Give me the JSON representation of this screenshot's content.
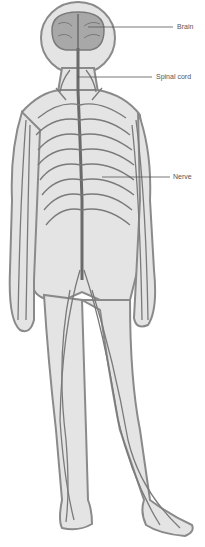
{
  "diagram": {
    "labels": [
      {
        "text": "Brain",
        "x": 177,
        "y": 25,
        "line_from": [
          88,
          27
        ],
        "line_to": [
          173,
          27
        ]
      },
      {
        "text": "Spinal cord",
        "x": 156,
        "y": 73,
        "line_from": [
          77,
          77
        ],
        "line_to": [
          152,
          77
        ]
      },
      {
        "text": "Nerve",
        "x": 173,
        "y": 174,
        "line_from": [
          102,
          177
        ],
        "line_to": [
          170,
          177
        ]
      }
    ],
    "colors": {
      "body_fill": "#e4e4e4",
      "body_outline": "#8a8a8a",
      "nerve": "#7a7a7a",
      "brain": "#9a9a9a",
      "label_text": "#555555",
      "leader_line": "#555555"
    }
  }
}
